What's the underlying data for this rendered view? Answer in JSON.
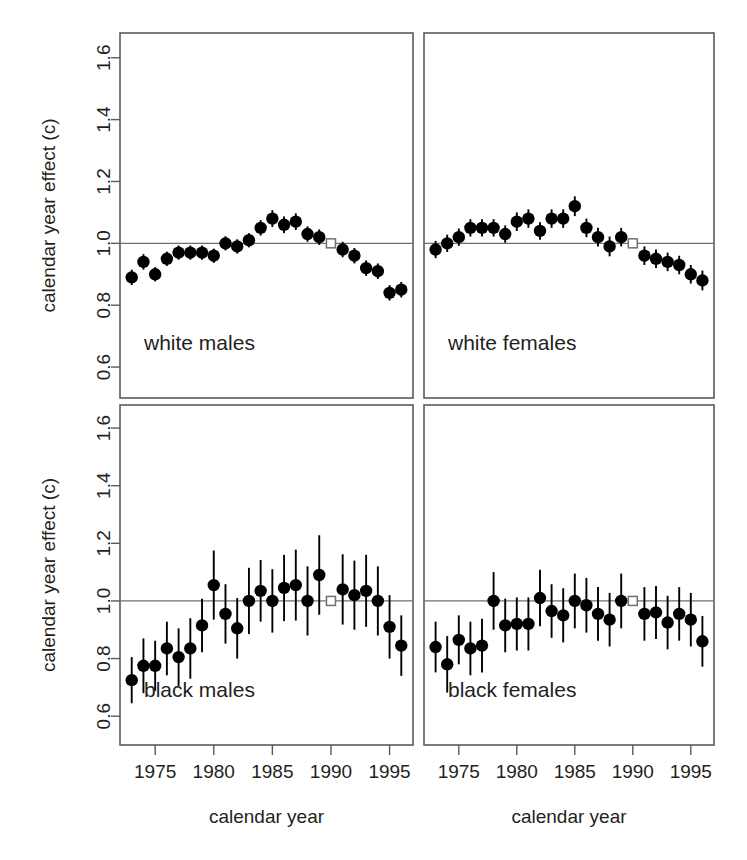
{
  "figure": {
    "title": "",
    "xlabel": "calendar year",
    "ylabel": "calendar year effect (c)"
  },
  "chart_data": {
    "type": "scatter",
    "title": "",
    "xlabel": "calendar year",
    "ylabel": "calendar year effect (c)",
    "xlim": [
      1972,
      1997
    ],
    "ylim": [
      0.5,
      1.68
    ],
    "xticks": [
      1975,
      1980,
      1985,
      1990,
      1995
    ],
    "yticks": [
      0.6,
      0.8,
      1.0,
      1.2,
      1.4,
      1.6
    ],
    "ytick_labels": [
      "0.6",
      "0.8",
      "1.0",
      "1.2",
      "1.4",
      "1.6"
    ],
    "xtick_labels": [
      "1975",
      "1980",
      "1985",
      "1990",
      "1995"
    ],
    "grid": false,
    "legend": null,
    "reference_line_y": 1.0,
    "reference_year": 1990,
    "reference_marker": "open-square",
    "marker": "filled-circle-with-vertical-errorbar",
    "panels": [
      {
        "id": "white-males",
        "label": "white males",
        "position": "top-left",
        "x": [
          1973,
          1974,
          1975,
          1976,
          1977,
          1978,
          1979,
          1980,
          1981,
          1982,
          1983,
          1984,
          1985,
          1986,
          1987,
          1988,
          1989,
          1990,
          1991,
          1992,
          1993,
          1994,
          1995,
          1996
        ],
        "y": [
          0.89,
          0.94,
          0.9,
          0.95,
          0.97,
          0.97,
          0.97,
          0.96,
          1.0,
          0.99,
          1.01,
          1.05,
          1.08,
          1.06,
          1.07,
          1.03,
          1.02,
          1.0,
          0.98,
          0.96,
          0.92,
          0.91,
          0.84,
          0.85
        ],
        "ylo": [
          0.865,
          0.915,
          0.877,
          0.927,
          0.947,
          0.947,
          0.947,
          0.937,
          0.977,
          0.967,
          0.987,
          1.025,
          1.053,
          1.033,
          1.043,
          1.005,
          0.995,
          1.0,
          0.955,
          0.935,
          0.895,
          0.885,
          0.815,
          0.825
        ],
        "yhi": [
          0.915,
          0.965,
          0.923,
          0.973,
          0.993,
          0.993,
          0.993,
          0.983,
          1.023,
          1.013,
          1.033,
          1.075,
          1.107,
          1.087,
          1.097,
          1.055,
          1.045,
          1.0,
          1.005,
          0.985,
          0.945,
          0.935,
          0.865,
          0.875
        ]
      },
      {
        "id": "white-females",
        "label": "white females",
        "position": "top-right",
        "x": [
          1973,
          1974,
          1975,
          1976,
          1977,
          1978,
          1979,
          1980,
          1981,
          1982,
          1983,
          1984,
          1985,
          1986,
          1987,
          1988,
          1989,
          1990,
          1991,
          1992,
          1993,
          1994,
          1995,
          1996
        ],
        "y": [
          0.98,
          1.0,
          1.02,
          1.05,
          1.05,
          1.05,
          1.03,
          1.07,
          1.08,
          1.04,
          1.08,
          1.08,
          1.12,
          1.05,
          1.02,
          0.99,
          1.02,
          1.0,
          0.96,
          0.95,
          0.94,
          0.93,
          0.9,
          0.88
        ],
        "ylo": [
          0.952,
          0.972,
          0.992,
          1.022,
          1.022,
          1.022,
          1.002,
          1.04,
          1.05,
          1.012,
          1.05,
          1.05,
          1.088,
          1.02,
          0.99,
          0.958,
          0.99,
          1.0,
          0.93,
          0.92,
          0.91,
          0.9,
          0.87,
          0.848
        ],
        "yhi": [
          1.008,
          1.028,
          1.048,
          1.078,
          1.078,
          1.078,
          1.058,
          1.1,
          1.11,
          1.068,
          1.11,
          1.11,
          1.152,
          1.08,
          1.05,
          1.022,
          1.05,
          1.0,
          0.99,
          0.98,
          0.97,
          0.96,
          0.93,
          0.912
        ]
      },
      {
        "id": "black-males",
        "label": "black males",
        "position": "bottom-left",
        "x": [
          1973,
          1974,
          1975,
          1976,
          1977,
          1978,
          1979,
          1980,
          1981,
          1982,
          1983,
          1984,
          1985,
          1986,
          1987,
          1988,
          1989,
          1990,
          1991,
          1992,
          1993,
          1994,
          1995,
          1996
        ],
        "y": [
          0.725,
          0.775,
          0.775,
          0.835,
          0.805,
          0.835,
          0.915,
          1.055,
          0.955,
          0.905,
          1.0,
          1.035,
          1.0,
          1.045,
          1.055,
          1.0,
          1.09,
          1.0,
          1.04,
          1.02,
          1.035,
          1.0,
          0.91,
          0.845
        ],
        "ylo": [
          0.645,
          0.68,
          0.688,
          0.742,
          0.705,
          0.73,
          0.822,
          0.935,
          0.852,
          0.8,
          0.885,
          0.928,
          0.89,
          0.93,
          0.932,
          0.88,
          0.952,
          1.0,
          0.918,
          0.9,
          0.91,
          0.88,
          0.8,
          0.74
        ],
        "yhi": [
          0.805,
          0.87,
          0.862,
          0.928,
          0.905,
          0.94,
          1.008,
          1.175,
          1.058,
          1.01,
          1.115,
          1.142,
          1.11,
          1.16,
          1.178,
          1.12,
          1.228,
          1.0,
          1.162,
          1.14,
          1.16,
          1.12,
          1.02,
          0.95
        ]
      },
      {
        "id": "black-females",
        "label": "black females",
        "position": "bottom-right",
        "x": [
          1973,
          1974,
          1975,
          1976,
          1977,
          1978,
          1979,
          1980,
          1981,
          1982,
          1983,
          1984,
          1985,
          1986,
          1987,
          1988,
          1989,
          1990,
          1991,
          1992,
          1993,
          1994,
          1995,
          1996
        ],
        "y": [
          0.84,
          0.78,
          0.865,
          0.835,
          0.845,
          1.0,
          0.915,
          0.92,
          0.92,
          1.01,
          0.965,
          0.95,
          1.0,
          0.985,
          0.955,
          0.935,
          1.0,
          1.0,
          0.955,
          0.96,
          0.925,
          0.955,
          0.935,
          0.86
        ],
        "ylo": [
          0.752,
          0.682,
          0.78,
          0.742,
          0.752,
          0.9,
          0.822,
          0.828,
          0.828,
          0.912,
          0.872,
          0.856,
          0.905,
          0.89,
          0.862,
          0.842,
          0.905,
          1.0,
          0.862,
          0.868,
          0.832,
          0.862,
          0.842,
          0.772
        ],
        "yhi": [
          0.928,
          0.878,
          0.95,
          0.928,
          0.938,
          1.1,
          1.008,
          1.012,
          1.012,
          1.108,
          1.058,
          1.044,
          1.095,
          1.08,
          1.048,
          1.028,
          1.095,
          1.0,
          1.048,
          1.052,
          1.018,
          1.048,
          1.028,
          0.948
        ]
      }
    ]
  }
}
